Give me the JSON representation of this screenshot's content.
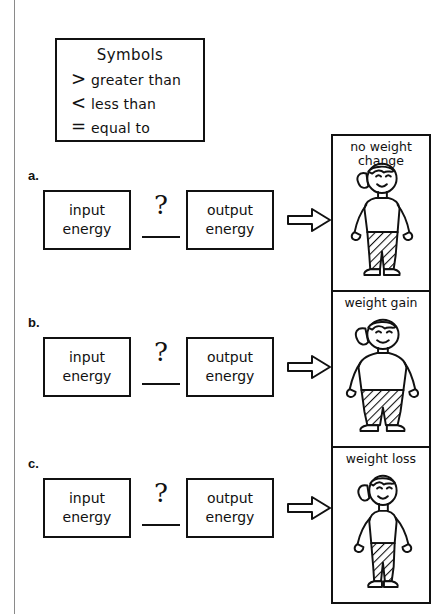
{
  "legend": {
    "title": "Symbols",
    "entries": [
      {
        "symbol": ">",
        "label": "greater than"
      },
      {
        "symbol": "<",
        "label": "less than"
      },
      {
        "symbol": "=",
        "label": "equal to"
      }
    ]
  },
  "rows": [
    {
      "label": "a.",
      "input_line1": "input",
      "input_line2": "energy",
      "compare_symbol": "?",
      "answer_value": "",
      "output_line1": "output",
      "output_line2": "energy",
      "arrow": "right-arrow-icon"
    },
    {
      "label": "b.",
      "input_line1": "input",
      "input_line2": "energy",
      "compare_symbol": "?",
      "answer_value": "",
      "output_line1": "output",
      "output_line2": "energy",
      "arrow": "right-arrow-icon"
    },
    {
      "label": "c.",
      "input_line1": "input",
      "input_line2": "energy",
      "compare_symbol": "?",
      "answer_value": "",
      "output_line1": "output",
      "output_line2": "energy",
      "arrow": "right-arrow-icon"
    }
  ],
  "panels": [
    {
      "caption_line1": "no weight",
      "caption_line2": "change",
      "body": "average"
    },
    {
      "caption_line1": "weight gain",
      "caption_line2": "",
      "body": "heavy"
    },
    {
      "caption_line1": "weight loss",
      "caption_line2": "",
      "body": "thin"
    }
  ],
  "colors": {
    "ink": "#111111",
    "paper": "#ffffff",
    "rule": "#8a8a8a"
  }
}
